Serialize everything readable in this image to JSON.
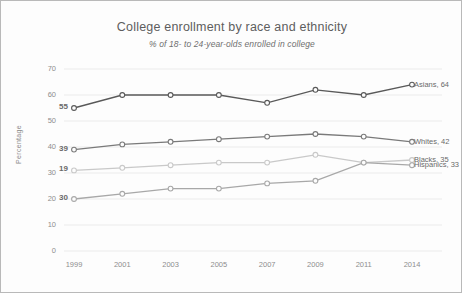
{
  "chart_data": {
    "type": "line",
    "title": "College enrollment by race and ethnicity",
    "subtitle": "% of 18- to 24-year-olds enrolled in college",
    "xlabel": "",
    "ylabel": "Percentage",
    "categories": [
      "1999",
      "2001",
      "2003",
      "2005",
      "2007",
      "2009",
      "2011",
      "2014"
    ],
    "ylim": [
      0,
      70
    ],
    "yticks": [
      "0",
      "10",
      "20",
      "30",
      "40",
      "50",
      "60",
      "70"
    ],
    "grid": true,
    "legend": "end-of-line labels",
    "series": [
      {
        "name": "Asians",
        "color": "#595959",
        "values": [
          55,
          60,
          60,
          60,
          57,
          62,
          60,
          64
        ],
        "start_label": "55",
        "end_label": "Asians, 64"
      },
      {
        "name": "Whites",
        "color": "#7a7a7a",
        "values": [
          39,
          41,
          42,
          43,
          44,
          45,
          44,
          42
        ],
        "start_label": "39",
        "end_label": "Whites, 42"
      },
      {
        "name": "Blacks",
        "color": "#c9c9c9",
        "values": [
          31,
          32,
          33,
          34,
          34,
          37,
          34,
          35
        ],
        "start_label": "19",
        "end_label": "Blacks, 35"
      },
      {
        "name": "Hispanics",
        "color": "#a8a8a8",
        "values": [
          20,
          22,
          24,
          24,
          26,
          27,
          34,
          33
        ],
        "start_label": "30",
        "end_label": "Hispanics, 33"
      }
    ]
  }
}
